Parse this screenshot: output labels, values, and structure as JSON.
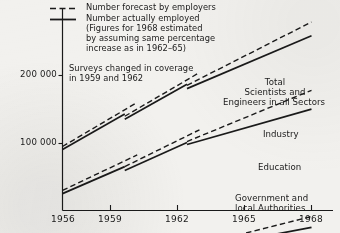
{
  "chart_data": {
    "type": "line",
    "title": "",
    "xlabel": "",
    "ylabel": "",
    "x_ticks": [
      "1956",
      "1959",
      "1962",
      "1965",
      "1968"
    ],
    "x_tick_values": [
      1956,
      1959,
      1962,
      1965,
      1968
    ],
    "y_ticks": [
      "100 000",
      "200 000"
    ],
    "y_tick_values": [
      100000,
      200000
    ],
    "y_scale": "logarithmic",
    "xlim": [
      1956,
      1968
    ],
    "grid": false,
    "legend_position": "top-left",
    "legend": [
      {
        "style": "dashed",
        "label": "Number forecast by employers"
      },
      {
        "style": "solid",
        "label": "Number actually employed\n(Figures for 1968 estimated\nby assuming same percentage\nincrease as in 1962–65)"
      }
    ],
    "annotations": [
      {
        "text": "Surveys changed in coverage\nin 1959 and 1962",
        "x": 1956.3,
        "y": 205000
      }
    ],
    "series": [
      {
        "name": "Total Scientists and Engineers in all Sectors",
        "label": "Total\nScientists and\nEngineers in all Sectors",
        "segments": [
          {
            "style": "solid",
            "x": [
              1956,
              1959
            ],
            "values": [
              94000,
              135000
            ]
          },
          {
            "style": "dashed",
            "x": [
              1956,
              1959.6
            ],
            "values": [
              97000,
              152000
            ]
          },
          {
            "style": "solid",
            "x": [
              1959,
              1962
            ],
            "values": [
              128000,
              183000
            ]
          },
          {
            "style": "dashed",
            "x": [
              1959,
              1962.6
            ],
            "values": [
              132000,
              206000
            ]
          },
          {
            "style": "solid",
            "x": [
              1962,
              1968
            ],
            "values": [
              175000,
              300000
            ]
          },
          {
            "style": "dashed",
            "x": [
              1962,
              1968
            ],
            "values": [
              181000,
              345000
            ]
          }
        ]
      },
      {
        "name": "Industry",
        "label": "Industry",
        "segments": [
          {
            "style": "solid",
            "x": [
              1956,
              1959
            ],
            "values": [
              60000,
              79000
            ]
          },
          {
            "style": "dashed",
            "x": [
              1956,
              1959.6
            ],
            "values": [
              62000,
              89000
            ]
          },
          {
            "style": "solid",
            "x": [
              1959,
              1962
            ],
            "values": [
              76000,
              101000
            ]
          },
          {
            "style": "dashed",
            "x": [
              1959,
              1962.6
            ],
            "values": [
              79000,
              115000
            ]
          },
          {
            "style": "solid",
            "x": [
              1962,
              1968
            ],
            "values": [
              99000,
              142000
            ]
          },
          {
            "style": "dashed",
            "x": [
              1962,
              1968
            ],
            "values": [
              102000,
              172000
            ]
          }
        ]
      },
      {
        "name": "Education",
        "label": "Education",
        "segments": [
          {
            "style": "solid",
            "x": [
              1956,
              1959
            ],
            "values": [
              25500,
              28500
            ]
          },
          {
            "style": "dashed",
            "x": [
              1956,
              1959.6
            ],
            "values": [
              26200,
              30000
            ]
          },
          {
            "style": "solid",
            "x": [
              1959,
              1962
            ],
            "values": [
              28000,
              32500
            ]
          },
          {
            "style": "dashed",
            "x": [
              1959,
              1962.6
            ],
            "values": [
              28800,
              35500
            ]
          },
          {
            "style": "solid",
            "x": [
              1962,
              1968
            ],
            "values": [
              33500,
              42500
            ]
          },
          {
            "style": "dashed",
            "x": [
              1962,
              1968
            ],
            "values": [
              34500,
              47500
            ]
          }
        ]
      },
      {
        "name": "Government and local Authorities",
        "label": "Government and\nlocal Authorities",
        "segments": [
          {
            "style": "solid",
            "x": [
              1956,
              1959
            ],
            "values": [
              22000,
              24200
            ]
          },
          {
            "style": "dashed",
            "x": [
              1956,
              1959.6
            ],
            "values": [
              21200,
              23800
            ]
          },
          {
            "style": "solid",
            "x": [
              1959,
              1962
            ],
            "values": [
              24000,
              26500
            ]
          },
          {
            "style": "dashed",
            "x": [
              1959,
              1962.6
            ],
            "values": [
              23400,
              26000
            ]
          },
          {
            "style": "solid",
            "x": [
              1962,
              1968
            ],
            "values": [
              26800,
              34500
            ]
          },
          {
            "style": "dashed",
            "x": [
              1962,
              1968
            ],
            "values": [
              26200,
              30500
            ]
          }
        ]
      }
    ]
  },
  "legend": {
    "forecast_label": "Number forecast by employers",
    "employed_label_line1": "Number actually employed",
    "employed_label_line2": "(Figures for 1968 estimated",
    "employed_label_line3": "by assuming same percentage",
    "employed_label_line4": "increase as in 1962–65)"
  },
  "note": {
    "line1": "Surveys changed in coverage",
    "line2": "in 1959 and 1962"
  },
  "axis": {
    "y_label_200k": "200 000",
    "y_label_100k": "100 000",
    "x_label_1956": "1956",
    "x_label_1959": "1959",
    "x_label_1962": "1962",
    "x_label_1965": "1965",
    "x_label_1968": "1968"
  },
  "series_labels": {
    "total_line1": "Total",
    "total_line2": "Scientists and",
    "total_line3": "Engineers in all Sectors",
    "industry": "Industry",
    "education": "Education",
    "government_line1": "Government and",
    "government_line2": "local Authorities"
  },
  "colors": {
    "ink": "#1a1a1a",
    "paper": "#f2f1ee"
  }
}
